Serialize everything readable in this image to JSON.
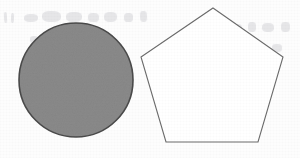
{
  "page": {
    "kind": "scanned-geometry-figure",
    "background_color": "#fdfdfd",
    "width": 300,
    "height": 158,
    "ghost_text_note": "illegible bleed-through from reverse side of page"
  },
  "figures": [
    {
      "name": "circle",
      "shape": "circle",
      "filled": true,
      "fill_color": "#8a8a8a",
      "stroke_color": "#4a4a4a",
      "stroke_width": 1.6,
      "center_x": 76,
      "center_y": 80,
      "radius": 57
    },
    {
      "name": "pentagon",
      "shape": "regular-pentagon",
      "sides": 5,
      "filled": false,
      "fill_color": "#ffffff",
      "stroke_color": "#6a6a6a",
      "stroke_width": 1.1,
      "center_x": 212,
      "center_y": 78,
      "points": "213,8 283,57 258,142 166,142 141,57",
      "vertices": [
        {
          "label": "apex",
          "x": 213,
          "y": 8
        },
        {
          "label": "upper-right",
          "x": 283,
          "y": 57
        },
        {
          "label": "lower-right",
          "x": 258,
          "y": 142
        },
        {
          "label": "lower-left",
          "x": 166,
          "y": 142
        },
        {
          "label": "upper-left",
          "x": 141,
          "y": 57
        }
      ]
    }
  ],
  "ghost_marks": [
    {
      "x": 4,
      "y": 12,
      "w": 3,
      "h": 11,
      "rot": -3
    },
    {
      "x": 11,
      "y": 13,
      "w": 3,
      "h": 10,
      "rot": 2
    },
    {
      "x": 24,
      "y": 14,
      "w": 14,
      "h": 8,
      "rot": -2
    },
    {
      "x": 42,
      "y": 11,
      "w": 19,
      "h": 11,
      "rot": 1
    },
    {
      "x": 66,
      "y": 12,
      "w": 16,
      "h": 10,
      "rot": -1
    },
    {
      "x": 88,
      "y": 13,
      "w": 11,
      "h": 9,
      "rot": 3
    },
    {
      "x": 104,
      "y": 12,
      "w": 13,
      "h": 10,
      "rot": -2
    },
    {
      "x": 124,
      "y": 13,
      "w": 9,
      "h": 9,
      "rot": 1
    },
    {
      "x": 140,
      "y": 11,
      "w": 7,
      "h": 11,
      "rot": -3
    },
    {
      "x": 232,
      "y": 24,
      "w": 10,
      "h": 9,
      "rot": 2
    },
    {
      "x": 248,
      "y": 22,
      "w": 8,
      "h": 10,
      "rot": -1
    },
    {
      "x": 262,
      "y": 23,
      "w": 12,
      "h": 9,
      "rot": 2
    },
    {
      "x": 281,
      "y": 22,
      "w": 9,
      "h": 10,
      "rot": -2
    },
    {
      "x": 236,
      "y": 44,
      "w": 9,
      "h": 8,
      "rot": 1
    },
    {
      "x": 252,
      "y": 43,
      "w": 13,
      "h": 9,
      "rot": -2
    },
    {
      "x": 272,
      "y": 44,
      "w": 10,
      "h": 8,
      "rot": 2
    },
    {
      "x": 30,
      "y": 36,
      "w": 8,
      "h": 7,
      "rot": 2
    },
    {
      "x": 96,
      "y": 34,
      "w": 7,
      "h": 7,
      "rot": -2
    }
  ]
}
